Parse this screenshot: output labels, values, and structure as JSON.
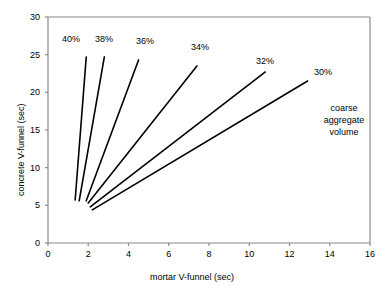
{
  "chart_data": {
    "type": "line",
    "title": "",
    "xlabel": "mortar V-funnel (sec)",
    "ylabel": "concrete V-funnel (sec)",
    "xlim": [
      0,
      16
    ],
    "ylim": [
      0,
      30
    ],
    "xticks": [
      0,
      2,
      4,
      6,
      8,
      10,
      12,
      14,
      16
    ],
    "yticks": [
      0,
      5,
      10,
      15,
      20,
      25,
      30
    ],
    "grid": false,
    "legend": "inline-labels",
    "annotation": "coarse aggregate volume",
    "annotation_lines": [
      "coarse",
      "aggregate",
      "volume"
    ],
    "line_color": "#000000",
    "series": [
      {
        "name": "40%",
        "label": "40%",
        "x": [
          1.35,
          1.9
        ],
        "y": [
          5.7,
          24.7
        ]
      },
      {
        "name": "38%",
        "label": "38%",
        "x": [
          1.55,
          2.8
        ],
        "y": [
          5.6,
          24.7
        ]
      },
      {
        "name": "36%",
        "label": "36%",
        "x": [
          1.9,
          4.5
        ],
        "y": [
          5.6,
          24.3
        ]
      },
      {
        "name": "34%",
        "label": "34%",
        "x": [
          2.0,
          7.4
        ],
        "y": [
          5.3,
          23.5
        ]
      },
      {
        "name": "32%",
        "label": "32%",
        "x": [
          2.1,
          10.8
        ],
        "y": [
          4.8,
          22.7
        ]
      },
      {
        "name": "30%",
        "label": "30%",
        "x": [
          2.2,
          12.9
        ],
        "y": [
          4.4,
          21.5
        ]
      }
    ]
  },
  "axes": {
    "x_title": "mortar V-funnel (sec)",
    "y_title": "concrete V-funnel (sec)",
    "x_ticks": [
      "0",
      "2",
      "4",
      "6",
      "8",
      "10",
      "12",
      "14",
      "16"
    ],
    "y_ticks": [
      "0",
      "5",
      "10",
      "15",
      "20",
      "25",
      "30"
    ]
  },
  "labels": {
    "s0": "40%",
    "s1": "38%",
    "s2": "36%",
    "s3": "34%",
    "s4": "32%",
    "s5": "30%"
  },
  "annotation": {
    "line1": "coarse",
    "line2": "aggregate",
    "line3": "volume"
  }
}
